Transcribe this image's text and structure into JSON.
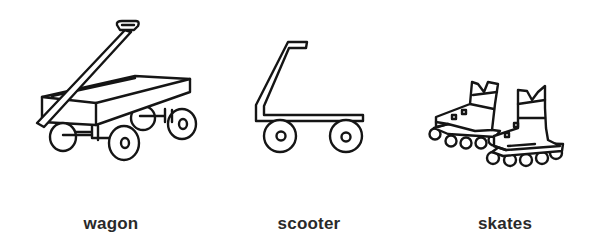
{
  "items": [
    {
      "id": "wagon",
      "label": "wagon",
      "icon": "wagon-icon"
    },
    {
      "id": "scooter",
      "label": "scooter",
      "icon": "scooter-icon"
    },
    {
      "id": "skates",
      "label": "skates",
      "icon": "inline-skates-icon"
    }
  ],
  "colors": {
    "background": "#ffffff",
    "line": "#151515",
    "text": "#2a2a2a"
  }
}
